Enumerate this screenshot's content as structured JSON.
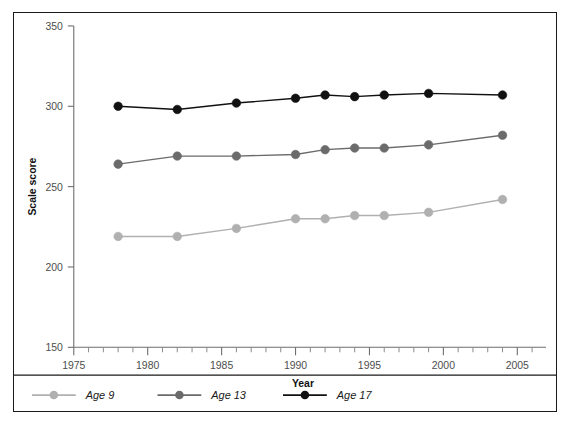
{
  "chart_data": {
    "type": "line",
    "title": "",
    "xlabel": "Year",
    "ylabel": "Scale score",
    "xlim": [
      1975,
      2006
    ],
    "ylim": [
      150,
      350
    ],
    "yticks": [
      150,
      200,
      250,
      300,
      350
    ],
    "xticks": [
      1975,
      1980,
      1985,
      1990,
      1995,
      2000,
      2005
    ],
    "x_minor_tick_step": 1,
    "grid": false,
    "legend_position": "bottom-left",
    "series": [
      {
        "name": "Age 9",
        "color": "#b0b0b0",
        "marker": "circle",
        "x": [
          1978,
          1982,
          1986,
          1990,
          1992,
          1994,
          1996,
          1999,
          2004
        ],
        "values": [
          219,
          219,
          224,
          230,
          230,
          232,
          232,
          234,
          242
        ]
      },
      {
        "name": "Age 13",
        "color": "#6b6b6b",
        "marker": "circle",
        "x": [
          1978,
          1982,
          1986,
          1990,
          1992,
          1994,
          1996,
          1999,
          2004
        ],
        "values": [
          264,
          269,
          269,
          270,
          273,
          274,
          274,
          276,
          282
        ]
      },
      {
        "name": "Age 17",
        "color": "#111111",
        "marker": "circle",
        "x": [
          1978,
          1982,
          1986,
          1990,
          1992,
          1994,
          1996,
          1999,
          2004
        ],
        "values": [
          300,
          298,
          302,
          305,
          307,
          306,
          307,
          308,
          307
        ]
      }
    ]
  },
  "legend": {
    "items": [
      {
        "label": "Age 9",
        "color": "#b0b0b0"
      },
      {
        "label": "Age 13",
        "color": "#6b6b6b"
      },
      {
        "label": "Age 17",
        "color": "#111111"
      }
    ]
  },
  "axes": {
    "y_title": "Scale score",
    "x_title": "Year"
  }
}
